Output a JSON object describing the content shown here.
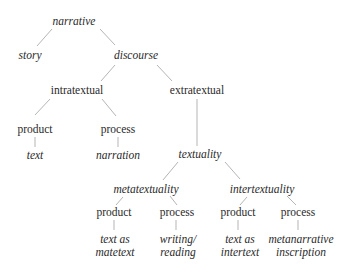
{
  "diagram": {
    "type": "tree",
    "nodes": {
      "narrative": {
        "label": "narrative",
        "style": "italic"
      },
      "story": {
        "label": "story",
        "style": "italic"
      },
      "discourse": {
        "label": "discourse",
        "style": "italic"
      },
      "intratextual": {
        "label": "intratextual",
        "style": "roman"
      },
      "extratextual": {
        "label": "extratextual",
        "style": "roman"
      },
      "intra_product": {
        "label": "product",
        "style": "roman"
      },
      "intra_process": {
        "label": "process",
        "style": "roman"
      },
      "text": {
        "label": "text",
        "style": "italic"
      },
      "narration": {
        "label": "narration",
        "style": "italic"
      },
      "textuality": {
        "label": "textuality",
        "style": "italic"
      },
      "metatextuality": {
        "label": "metatextuality",
        "style": "italic"
      },
      "intertextuality": {
        "label": "intertextuality",
        "style": "italic"
      },
      "meta_product": {
        "label": "product",
        "style": "roman"
      },
      "meta_process": {
        "label": "process",
        "style": "roman"
      },
      "inter_product": {
        "label": "product",
        "style": "roman"
      },
      "inter_process": {
        "label": "process",
        "style": "roman"
      },
      "text_as_matetext": {
        "line1": "text as",
        "line2": "matetext",
        "style": "italic"
      },
      "writing_reading": {
        "line1": "writing/",
        "line2": "reading",
        "style": "italic"
      },
      "text_as_intertext": {
        "line1": "text as",
        "line2": "intertext",
        "style": "italic"
      },
      "metanarrative_inscription": {
        "line1": "metanarrative",
        "line2": "inscription",
        "style": "italic"
      }
    },
    "edges": [
      [
        "narrative",
        "story"
      ],
      [
        "narrative",
        "discourse"
      ],
      [
        "discourse",
        "intratextual"
      ],
      [
        "discourse",
        "extratextual"
      ],
      [
        "intratextual",
        "intra_product"
      ],
      [
        "intratextual",
        "intra_process"
      ],
      [
        "intra_product",
        "text"
      ],
      [
        "intra_process",
        "narration"
      ],
      [
        "extratextual",
        "textuality"
      ],
      [
        "textuality",
        "metatextuality"
      ],
      [
        "textuality",
        "intertextuality"
      ],
      [
        "metatextuality",
        "meta_product"
      ],
      [
        "metatextuality",
        "meta_process"
      ],
      [
        "intertextuality",
        "inter_product"
      ],
      [
        "intertextuality",
        "inter_process"
      ],
      [
        "meta_product",
        "text_as_matetext"
      ],
      [
        "meta_process",
        "writing_reading"
      ],
      [
        "inter_product",
        "text_as_intertext"
      ],
      [
        "inter_process",
        "metanarrative_inscription"
      ]
    ],
    "edge_color": "#b5b5b5",
    "text_color": "#2a2a2a"
  }
}
